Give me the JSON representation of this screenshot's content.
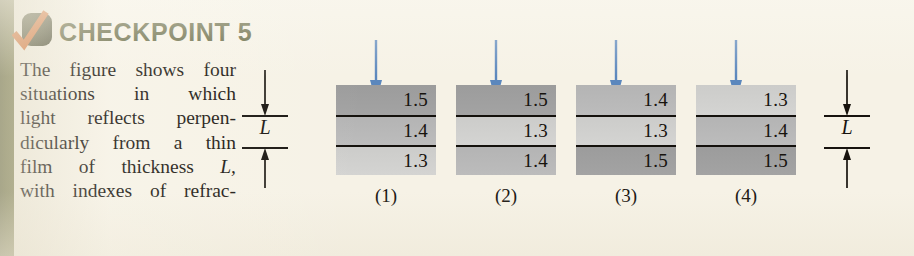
{
  "header": {
    "title": "CHECKPOINT 5",
    "badge_icon": "check-mark-icon",
    "badge_color": "#3b3d22",
    "check_color": "#d4621f",
    "title_color": "#4e5127"
  },
  "body_text": {
    "lines": [
      "The figure shows four",
      "situations in which",
      "light reflects perpen-",
      "dicularly from a thin",
      "film of thickness L,",
      "with indexes of refrac-"
    ],
    "full_text": "The figure shows four situations in which light reflects perpendicularly from a thin film of thickness L, with indexes of refrac-"
  },
  "figure": {
    "dimension_label": "L",
    "arrow_color": "#5b87bd",
    "layer_shades": {
      "1.5": "#a0a0a0",
      "1.4": "#b8b8b8",
      "1.3": "#d0d0ce"
    },
    "stacks": [
      {
        "caption": "(1)",
        "layers": [
          {
            "index": "1.5",
            "shade": "sh-15"
          },
          {
            "index": "1.4",
            "shade": "sh-14"
          },
          {
            "index": "1.3",
            "shade": "sh-13"
          }
        ]
      },
      {
        "caption": "(2)",
        "layers": [
          {
            "index": "1.5",
            "shade": "sh-15"
          },
          {
            "index": "1.3",
            "shade": "sh-13"
          },
          {
            "index": "1.4",
            "shade": "sh-14"
          }
        ]
      },
      {
        "caption": "(3)",
        "layers": [
          {
            "index": "1.4",
            "shade": "sh-14"
          },
          {
            "index": "1.3",
            "shade": "sh-13"
          },
          {
            "index": "1.5",
            "shade": "sh-15"
          }
        ]
      },
      {
        "caption": "(4)",
        "layers": [
          {
            "index": "1.3",
            "shade": "sh-13"
          },
          {
            "index": "1.4",
            "shade": "sh-14"
          },
          {
            "index": "1.5",
            "shade": "sh-15"
          }
        ]
      }
    ]
  }
}
